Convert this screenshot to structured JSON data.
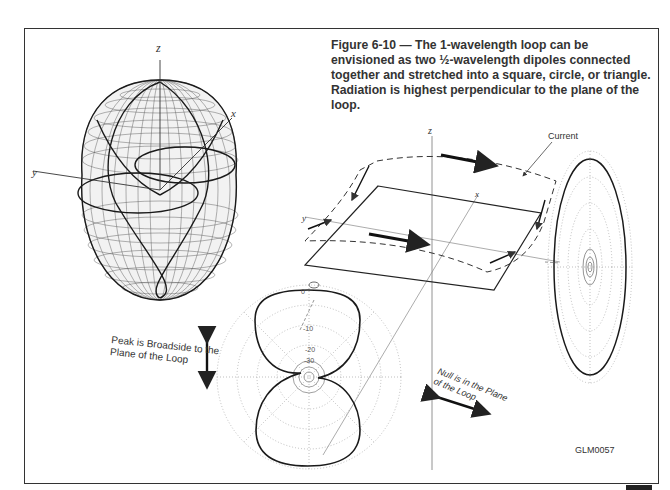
{
  "figure": {
    "caption": "Figure 6-10 — The 1-wavelength loop can be envisioned as two ½-wavelength dipoles connected together and stretched into a square, circle, or triangle. Radiation is highest perpendicular to the plane of the loop.",
    "code": "GLM0057"
  },
  "pattern_3d": {
    "axes": {
      "z": "z",
      "x": "x",
      "y": "y"
    }
  },
  "loop_diagram": {
    "axes": {
      "z": "z",
      "x": "x",
      "y": "y"
    },
    "current_label": "Current"
  },
  "elevation_pattern": {
    "ring_labels": [
      "0",
      "-10",
      "-20",
      "-30"
    ],
    "annotation": "Peak is Broadside to the Plane of the Loop"
  },
  "azimuth_pattern": {
    "annotation": "Null is in the Plane of the Loop"
  },
  "colors": {
    "ink": "#222222",
    "grid": "#9a9a9a",
    "frame": "#333333"
  }
}
